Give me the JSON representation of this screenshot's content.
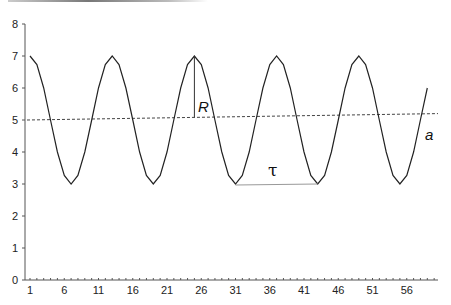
{
  "chart_data": {
    "type": "line",
    "title": "",
    "xlabel": "",
    "ylabel": "",
    "ylim": [
      0,
      8
    ],
    "xlim": [
      1,
      59
    ],
    "grid": false,
    "legend": null,
    "x_tick_labels": [
      "1",
      "6",
      "11",
      "16",
      "21",
      "26",
      "31",
      "36",
      "41",
      "46",
      "51",
      "56"
    ],
    "y_tick_labels": [
      "0",
      "1",
      "2",
      "3",
      "4",
      "5",
      "6",
      "7",
      "8"
    ],
    "x": [
      1,
      2,
      3,
      4,
      5,
      6,
      7,
      8,
      9,
      10,
      11,
      12,
      13,
      14,
      15,
      16,
      17,
      18,
      19,
      20,
      21,
      22,
      23,
      24,
      25,
      26,
      27,
      28,
      29,
      30,
      31,
      32,
      33,
      34,
      35,
      36,
      37,
      38,
      39,
      40,
      41,
      42,
      43,
      44,
      45,
      46,
      47,
      48,
      49,
      50,
      51,
      52,
      53,
      54,
      55,
      56,
      57,
      58,
      59
    ],
    "series": [
      {
        "name": "a",
        "style": "solid",
        "values": [
          7,
          6.73,
          6,
          5,
          4,
          3.27,
          3,
          3.27,
          4,
          5,
          6,
          6.73,
          7,
          6.73,
          6,
          5,
          4,
          3.27,
          3,
          3.27,
          4,
          5,
          6,
          6.73,
          7,
          6.73,
          6,
          5,
          4,
          3.27,
          3,
          3.27,
          4,
          5,
          6,
          6.73,
          7,
          6.73,
          6,
          5,
          4,
          3.27,
          3,
          3.27,
          4,
          5,
          6,
          6.73,
          7,
          6.73,
          6,
          5,
          4,
          3.27,
          3,
          3.27,
          4,
          5,
          6
        ]
      },
      {
        "name": "trend",
        "style": "dashed",
        "x": [
          0.5,
          60
        ],
        "values": [
          5.0,
          5.2
        ]
      }
    ],
    "annotations": [
      {
        "label": "R",
        "type": "vertical-segment",
        "x": 25,
        "from": 7,
        "to": 5.08,
        "meaning": "amplitude"
      },
      {
        "label": "τ",
        "type": "horizontal-segment",
        "y": 3,
        "from": 31,
        "to": 43,
        "meaning": "period"
      },
      {
        "label": "a",
        "type": "series-label",
        "x": 59,
        "y": 4.7
      }
    ]
  },
  "labels": {
    "R": "R",
    "tau": "τ",
    "a": "a"
  },
  "axis": {
    "y": [
      "0",
      "1",
      "2",
      "3",
      "4",
      "5",
      "6",
      "7",
      "8"
    ],
    "x": [
      "1",
      "6",
      "11",
      "16",
      "21",
      "26",
      "31",
      "36",
      "41",
      "46",
      "51",
      "56"
    ]
  }
}
